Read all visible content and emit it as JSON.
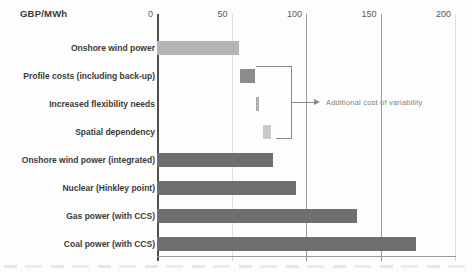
{
  "header": {
    "unit_label": "GBP/MWh"
  },
  "colors": {
    "bar_dark": "#6f6f6f",
    "bar_light_grey": "#b5b5b5",
    "bar_profile": "#8c8c8c",
    "bar_flexibility": "#aeaeae",
    "bar_spatial": "#c9c9c9",
    "axis_strong": "#4f4f4f",
    "axis_mid": "#9a9a9a",
    "axis_faint": "#dedede",
    "category_label": "#3b3b3b",
    "tick_label": "#5a5a5a",
    "annotation_grey": "#7f7f7f"
  },
  "chart_data": {
    "type": "bar",
    "orientation": "horizontal",
    "title": "GBP/MWh",
    "xlabel": "GBP/MWh",
    "ylabel": "",
    "xlim": [
      0,
      200
    ],
    "xticks": [
      "0",
      "50",
      "100",
      "150",
      "200"
    ],
    "grid": true,
    "legend": false,
    "gridline_styles": {
      "0": "strong",
      "50": "faint",
      "100": "mid",
      "150": "mid",
      "200": "faint"
    },
    "categories": [
      "Onshore wind power",
      "Profile costs (including back-up)",
      "Increased flexibility needs",
      "Spatial dependency",
      "Onshore wind power (integrated)",
      "Nuclear (Hinkley point)",
      "Gas power (with CCS)",
      "Coal power (with CCS)"
    ],
    "bars": [
      {
        "label": "Onshore wind power",
        "start": 0,
        "end": 55,
        "color": "#b5b5b5"
      },
      {
        "label": "Profile costs (including back-up)",
        "start": 55.5,
        "end": 65.5,
        "color": "#8c8c8c"
      },
      {
        "label": "Increased flexibility needs",
        "start": 66.5,
        "end": 68.5,
        "color": "#aeaeae"
      },
      {
        "label": "Spatial dependency",
        "start": 71,
        "end": 76.5,
        "color": "#c9c9c9"
      },
      {
        "label": "Onshore wind power (integrated)",
        "start": 0,
        "end": 78,
        "color": "#6f6f6f"
      },
      {
        "label": "Nuclear (Hinkley point)",
        "start": 0,
        "end": 93,
        "color": "#6f6f6f"
      },
      {
        "label": "Gas power (with CCS)",
        "start": 0,
        "end": 134,
        "color": "#6f6f6f"
      },
      {
        "label": "Coal power (with CCS)",
        "start": 0,
        "end": 174,
        "color": "#6f6f6f"
      }
    ],
    "annotation": {
      "text": "Additional cost of variability",
      "applies_to": [
        "Profile costs (including back-up)",
        "Increased flexibility needs",
        "Spatial dependency"
      ]
    }
  }
}
